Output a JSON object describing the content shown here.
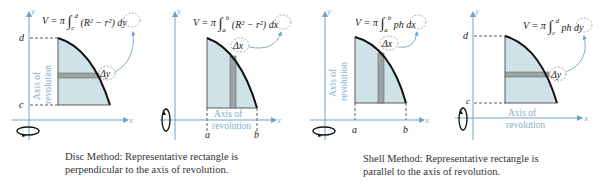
{
  "colors": {
    "axis": "#6fa3c9",
    "region_fill": "#cfe3e6",
    "strip_fill": "#9aa4a5",
    "curve": "#111111",
    "dashes": "#333333",
    "axis_text": "#7fb0cf"
  },
  "panels": [
    {
      "id": "disc-horizontal",
      "y_label": "y",
      "x_label": "x",
      "formula": "V = π ∫_c^d (R² − r²) dy",
      "formula_parts": {
        "lead": "V = π",
        "lower": "c",
        "upper": "d",
        "body": "(R² − r²)",
        "diff": "dy"
      },
      "delta_label": "Δy",
      "tick_labels": {
        "top": "d",
        "bottom": "c"
      },
      "axis_of_revolution": [
        "Axis of",
        "revolution"
      ],
      "axis": "y"
    },
    {
      "id": "disc-vertical",
      "y_label": "y",
      "x_label": "x",
      "formula": "V = π ∫_a^b (R² − r²) dx",
      "formula_parts": {
        "lead": "V = π",
        "lower": "a",
        "upper": "b",
        "body": "(R² − r²)",
        "diff": "dx"
      },
      "delta_label": "Δx",
      "tick_labels": {
        "left": "a",
        "right": "b"
      },
      "axis_of_revolution": [
        "Axis of",
        "revolution"
      ],
      "axis": "x"
    },
    {
      "id": "shell-vertical",
      "y_label": "y",
      "x_label": "x",
      "formula": "V = π ∫_a^b ph dx",
      "formula_parts": {
        "lead": "V = π",
        "lower": "a",
        "upper": "b",
        "body": "ph",
        "diff": "dx"
      },
      "delta_label": "Δx",
      "tick_labels": {
        "left": "a",
        "right": "b"
      },
      "axis_of_revolution": [
        "Axis of",
        "revolution"
      ],
      "axis": "y"
    },
    {
      "id": "shell-horizontal",
      "y_label": "y",
      "x_label": "x",
      "formula": "V = π ∫_c^d ph dy",
      "formula_parts": {
        "lead": "V = π",
        "lower": "c",
        "upper": "d",
        "body": "ph",
        "diff": "dy"
      },
      "delta_label": "Δy",
      "tick_labels": {
        "top": "d",
        "bottom": "c"
      },
      "axis_of_revolution": [
        "Axis of",
        "revolution"
      ],
      "axis": "x"
    }
  ],
  "captions": {
    "disc": {
      "line1": "Disc Method:  Representative rectangle is",
      "line2": "perpendicular to the axis of revolution."
    },
    "shell": {
      "line1": "Shell Method:  Representative rectangle is",
      "line2": "parallel to the axis of revolution."
    }
  }
}
